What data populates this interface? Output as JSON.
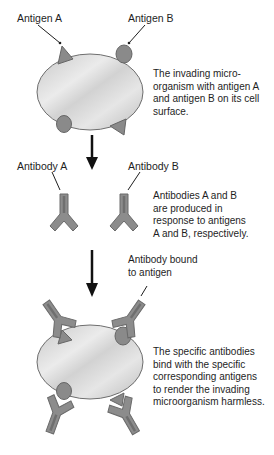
{
  "diagram": {
    "type": "process",
    "stages": [
      {
        "name": "microorganism-with-antigens",
        "labels": {
          "antigen_a": "Antigen A",
          "antigen_b": "Antigen B"
        },
        "description": [
          "The invading micro-",
          "organism with antigen A",
          "and antigen B on its cell",
          "surface."
        ]
      },
      {
        "name": "antibodies-produced",
        "labels": {
          "antibody_a": "Antibody A",
          "antibody_b": "Antibody B"
        },
        "description": [
          "Antibodies A and B",
          "are produced in",
          "response to antigens",
          "A and B, respectively."
        ]
      },
      {
        "name": "antibodies-bound",
        "labels": {
          "bound": [
            "Antibody bound",
            "to antigen"
          ]
        },
        "description": [
          "The specific antibodies",
          "bind with the specific",
          "corresponding antigens",
          "to render the invading",
          "microorganism harmless."
        ]
      }
    ],
    "colors": {
      "cell_fill": "#d9d9d9",
      "cell_stroke": "#6e6e6e",
      "antigen_fill": "#8a8a8a",
      "antibody_fill": "#8c8c8c",
      "arrow": "#111111",
      "background": "#ffffff"
    }
  }
}
